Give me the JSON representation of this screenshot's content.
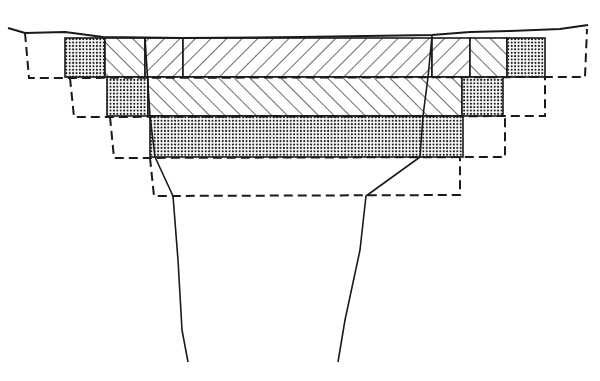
{
  "diagram": {
    "type": "cross-section",
    "colors": {
      "ink": "#1a1a1a",
      "background": "#ffffff",
      "stipple": "#1a1a1a"
    },
    "ground_line": [
      [
        8,
        28
      ],
      [
        25,
        33
      ],
      [
        65,
        32
      ],
      [
        103,
        37
      ],
      [
        183,
        38
      ],
      [
        300,
        37
      ],
      [
        432,
        35
      ],
      [
        470,
        32
      ],
      [
        510,
        31
      ],
      [
        560,
        29
      ],
      [
        588,
        25
      ]
    ],
    "layers": [
      {
        "name": "layer-1",
        "y_top": 38,
        "y_bottom": 77,
        "cells": [
          {
            "x1": 65,
            "x2": 105,
            "pattern": "stipple"
          },
          {
            "x1": 105,
            "x2": 145,
            "pattern": "hatch-back"
          },
          {
            "x1": 145,
            "x2": 183,
            "pattern": "hatch-forward"
          },
          {
            "x1": 183,
            "x2": 432,
            "pattern": "hatch-forward"
          },
          {
            "x1": 432,
            "x2": 470,
            "pattern": "hatch-forward"
          },
          {
            "x1": 470,
            "x2": 507,
            "pattern": "hatch-back"
          },
          {
            "x1": 507,
            "x2": 545,
            "pattern": "stipple"
          }
        ]
      },
      {
        "name": "layer-2",
        "y_top": 77,
        "y_bottom": 116,
        "cells": [
          {
            "x1": 107,
            "x2": 148,
            "pattern": "stipple"
          },
          {
            "x1": 148,
            "x2": 462,
            "pattern": "hatch-back"
          },
          {
            "x1": 462,
            "x2": 503,
            "pattern": "stipple"
          }
        ]
      },
      {
        "name": "layer-3",
        "y_top": 116,
        "y_bottom": 157,
        "cells": [
          {
            "x1": 150,
            "x2": 463,
            "pattern": "stipple"
          }
        ]
      }
    ],
    "dashed_steps": [
      {
        "left_x": 25,
        "right_x": 585,
        "bottom_y": 78
      },
      {
        "left_x": 70,
        "right_x": 545,
        "bottom_y": 117
      },
      {
        "left_x": 110,
        "right_x": 505,
        "bottom_y": 158
      },
      {
        "left_x": 150,
        "right_x": 460,
        "bottom_y": 196
      }
    ],
    "boundary_lines": [
      {
        "name": "left-boundary",
        "points": [
          [
            145,
            38
          ],
          [
            150,
            116
          ],
          [
            155,
            157
          ],
          [
            173,
            196
          ],
          [
            178,
            260
          ],
          [
            182,
            330
          ],
          [
            188,
            362
          ]
        ]
      },
      {
        "name": "right-boundary",
        "points": [
          [
            432,
            36
          ],
          [
            428,
            77
          ],
          [
            423,
            116
          ],
          [
            420,
            157
          ],
          [
            366,
            196
          ],
          [
            360,
            250
          ],
          [
            345,
            320
          ],
          [
            338,
            362
          ]
        ]
      }
    ]
  }
}
